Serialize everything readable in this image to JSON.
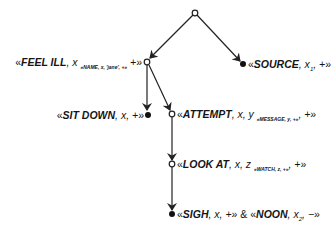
{
  "diagram": {
    "type": "tree",
    "edge_color": "#222222",
    "nodes": [
      {
        "id": "root",
        "kind": "open",
        "x": 195,
        "y": 13
      },
      {
        "id": "feel_ill",
        "kind": "open",
        "x": 147,
        "y": 62,
        "label": {
          "open": "«",
          "pred": "FEEL ILL",
          "args": ", x",
          "sub": "«NAME, x, 'jane', +»",
          "tail": " +",
          "close": "»"
        }
      },
      {
        "id": "source",
        "kind": "filled",
        "x": 243,
        "y": 64,
        "label": {
          "open": "«",
          "pred": "SOURCE",
          "args": ", x",
          "subn": "1",
          "tail": ", +",
          "close": "»"
        }
      },
      {
        "id": "sit_down",
        "kind": "filled",
        "x": 148,
        "y": 115,
        "label": {
          "open": "«",
          "pred": "SIT DOWN",
          "args": ", x, +",
          "close": "»"
        }
      },
      {
        "id": "attempt",
        "kind": "open",
        "x": 172,
        "y": 114,
        "label": {
          "open": "«",
          "pred": "ATTEMPT",
          "args": ", x, y",
          "sub": "«MESSAGE, y, +»",
          "tail": ", +",
          "close": "»"
        }
      },
      {
        "id": "look_at",
        "kind": "open",
        "x": 172,
        "y": 164,
        "label": {
          "open": "«",
          "pred": "LOOK AT",
          "args": ", x, z",
          "sub": "«WATCH, z, +»",
          "tail": ", +",
          "close": "»"
        }
      },
      {
        "id": "sigh_noon",
        "kind": "filled",
        "x": 172,
        "y": 214,
        "label": {
          "open": "«",
          "pred": "SIGH",
          "args": ", x, +",
          "close": "»",
          "conj": " & ",
          "open2": "«",
          "pred2": "NOON",
          "args2": ", x",
          "subn2": "2",
          "tail2": ", −",
          "close2": "»"
        }
      }
    ],
    "edges": [
      {
        "from": "root",
        "to": "feel_ill"
      },
      {
        "from": "root",
        "to": "source"
      },
      {
        "from": "feel_ill",
        "to": "sit_down"
      },
      {
        "from": "feel_ill",
        "to": "attempt"
      },
      {
        "from": "attempt",
        "to": "look_at"
      },
      {
        "from": "look_at",
        "to": "sigh_noon"
      }
    ]
  }
}
